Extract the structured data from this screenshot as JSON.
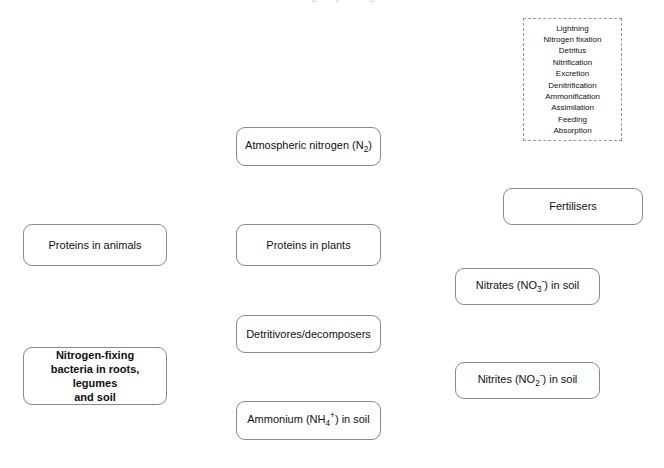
{
  "diagram": {
    "title_sliver": "The nitrogen cycle diagram",
    "word_bank": {
      "name": "word-bank",
      "items": [
        "Lightning",
        "Nitrogen fixation",
        "Detritus",
        "Nitrification",
        "Excretion",
        "Denitrification",
        "Ammonification",
        "Assimilation",
        "Feeding",
        "Absorption"
      ]
    },
    "nodes": [
      {
        "id": "atmospheric-nitrogen",
        "label": "Atmospheric nitrogen (N",
        "sub": "2",
        "suffix": ")",
        "bold": false
      },
      {
        "id": "fertilisers",
        "label": "Fertilisers",
        "bold": false
      },
      {
        "id": "proteins-in-animals",
        "label": "Proteins in animals",
        "bold": false
      },
      {
        "id": "proteins-in-plants",
        "label": "Proteins in plants",
        "bold": false
      },
      {
        "id": "nitrates-in-soil",
        "label": "Nitrates (NO",
        "sub": "3",
        "sup": "-",
        "suffix": ") in soil",
        "bold": false
      },
      {
        "id": "detritivores-decomposers",
        "label": "Detritivores/decomposers",
        "bold": false
      },
      {
        "id": "nitrogen-fixing-bacteria",
        "line1": "Nitrogen-fixing",
        "line2": "bacteria in roots, legumes",
        "line3": "and soil",
        "bold": true
      },
      {
        "id": "nitrites-in-soil",
        "label": "Nitrites (NO",
        "sub": "2",
        "sup": "-",
        "suffix": ") in soil",
        "bold": false
      },
      {
        "id": "ammonium-in-soil",
        "label": "Ammonium (NH",
        "sub": "4",
        "sup": "+",
        "suffix": ") in soil",
        "bold": false
      }
    ],
    "colors": {
      "border": "#8a8a8a",
      "dashed_border": "#9a9a9a",
      "text": "#111111",
      "background": "#ffffff"
    }
  }
}
